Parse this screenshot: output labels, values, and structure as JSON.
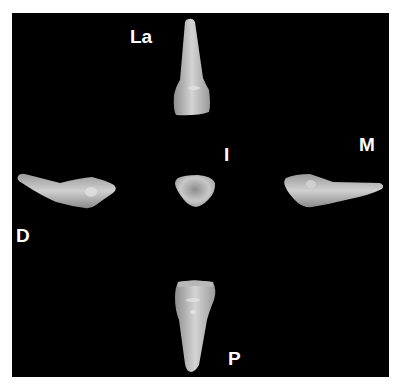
{
  "figure": {
    "labels": {
      "labial": "La",
      "incisal": "I",
      "mesial": "M",
      "distal": "D",
      "palatal": "P"
    },
    "colors": {
      "background": "#000000",
      "border": "#ffffff",
      "tooth": "#c8c8c8",
      "label": "#ffffff"
    }
  }
}
